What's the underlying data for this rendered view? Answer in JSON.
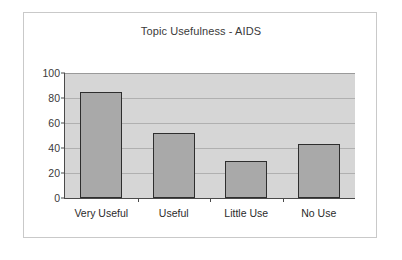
{
  "chart_data": {
    "type": "bar",
    "title": "Topic Usefulness - AIDS",
    "xlabel": "",
    "ylabel": "",
    "categories": [
      "Very Useful",
      "Useful",
      "Little Use",
      "No Use"
    ],
    "values": [
      85,
      52,
      30,
      43
    ],
    "ylim": [
      0,
      100
    ],
    "yticks": [
      0,
      20,
      40,
      60,
      80,
      100
    ],
    "ytick_labels": [
      "0",
      "20",
      "40",
      "60",
      "80",
      "100"
    ],
    "grid": true,
    "legend": false,
    "colors": {
      "bar_fill": "#a9a9a9",
      "bar_border": "#2e2e2e",
      "plot_background": "#d6d6d6",
      "gridline": "#b0b0b0",
      "axis": "#4a4a4a",
      "frame_border": "#c9c9c9",
      "canvas_background": "#ffffff",
      "text": "#2b2b2b"
    }
  }
}
